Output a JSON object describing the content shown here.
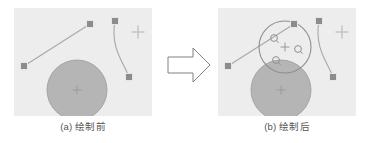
{
  "figure": {
    "title": "",
    "panels": [
      {
        "id": "a",
        "caption": "(a) 绘制前",
        "background_color": "#ededed",
        "shapes": {
          "line": {
            "name": "straight-line-segment",
            "color": "#a8a8a8",
            "start": [
              10,
              58
            ],
            "end": [
              76,
              16
            ]
          },
          "curve": {
            "name": "bezier-curve",
            "color": "#a8a8a8",
            "start": [
              101,
              13
            ],
            "control1": [
              96,
              40
            ],
            "control2": [
              110,
              55
            ],
            "end": [
              115,
              69
            ]
          },
          "filled_circle": {
            "name": "large-gray-disc",
            "fill": "#b5b5b5",
            "stroke": "#9a9a9a",
            "center": [
              63,
              82
            ],
            "radius": 30
          },
          "handles": [
            {
              "name": "handle-line-start",
              "x": 10,
              "y": 58
            },
            {
              "name": "handle-line-end",
              "x": 76,
              "y": 16
            },
            {
              "name": "handle-curve-start",
              "x": 101,
              "y": 13
            },
            {
              "name": "handle-curve-end",
              "x": 115,
              "y": 69
            }
          ],
          "crosshairs": [
            {
              "name": "crosshair-disc-center",
              "x": 63,
              "y": 82,
              "size": 9,
              "color": "#9a9a9a"
            },
            {
              "name": "crosshair-corner-marker",
              "x": 124,
              "y": 24,
              "size": 13,
              "color": "#c2c2c2"
            }
          ]
        }
      },
      {
        "id": "b",
        "caption": "(b) 绘制后",
        "background_color": "#ededed",
        "shapes": {
          "line": {
            "name": "straight-line-segment",
            "color": "#a8a8a8",
            "start": [
              10,
              58
            ],
            "end": [
              76,
              16
            ]
          },
          "curve": {
            "name": "bezier-curve",
            "color": "#a8a8a8",
            "start": [
              101,
              13
            ],
            "control1": [
              96,
              40
            ],
            "control2": [
              110,
              55
            ],
            "end": [
              115,
              69
            ]
          },
          "filled_circle": {
            "name": "large-gray-disc",
            "fill": "#b5b5b5",
            "stroke": "#9a9a9a",
            "center": [
              63,
              82
            ],
            "radius": 30
          },
          "outline_circle": {
            "name": "drawn-outline-circle",
            "stroke": "#8f8f8f",
            "fill": "none",
            "center": [
              67,
              39
            ],
            "radius": 26
          },
          "handles": [
            {
              "name": "handle-line-start",
              "x": 10,
              "y": 58
            },
            {
              "name": "handle-line-end",
              "x": 76,
              "y": 16
            },
            {
              "name": "handle-curve-start",
              "x": 101,
              "y": 13
            },
            {
              "name": "handle-curve-end",
              "x": 115,
              "y": 69
            }
          ],
          "node_markers": [
            {
              "name": "node-marker-upper-left",
              "x": 56,
              "y": 30
            },
            {
              "name": "node-marker-right",
              "x": 80,
              "y": 41
            },
            {
              "name": "node-marker-lower-left",
              "x": 58,
              "y": 52
            }
          ],
          "crosshairs": [
            {
              "name": "crosshair-disc-center",
              "x": 63,
              "y": 82,
              "size": 9,
              "color": "#9a9a9a"
            },
            {
              "name": "crosshair-outline-center",
              "x": 67,
              "y": 39,
              "size": 9,
              "color": "#9a9a9a"
            },
            {
              "name": "crosshair-corner-marker",
              "x": 124,
              "y": 24,
              "size": 13,
              "color": "#c2c2c2"
            }
          ]
        }
      }
    ],
    "arrow": {
      "name": "transition-arrow",
      "direction": "right",
      "stroke": "#808080",
      "fill": "#ffffff"
    },
    "colors": {
      "panel_background": "#ededed",
      "stroke": "#a8a8a8",
      "disc_fill": "#b5b5b5",
      "handle_fill": "#8c8c8c",
      "caption_text": "#555555"
    }
  }
}
